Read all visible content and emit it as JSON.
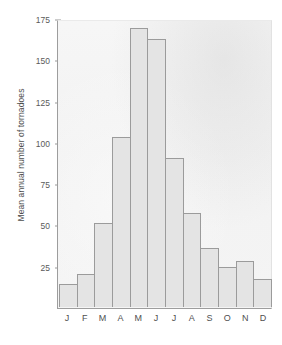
{
  "chart_data": {
    "type": "bar",
    "title": "",
    "xlabel": "",
    "ylabel": "Mean annual number of tornadoes",
    "categories": [
      "J",
      "F",
      "M",
      "A",
      "M",
      "J",
      "J",
      "A",
      "S",
      "O",
      "N",
      "D"
    ],
    "category_names": [
      "January",
      "February",
      "March",
      "April",
      "May",
      "June",
      "July",
      "August",
      "September",
      "October",
      "November",
      "December"
    ],
    "values": [
      14,
      20,
      51,
      103,
      169,
      162,
      90,
      57,
      36,
      24,
      28,
      17
    ],
    "ylim": [
      0,
      175
    ],
    "yticks": [
      25,
      50,
      75,
      100,
      125,
      150,
      175
    ],
    "ytick_labels": [
      "25",
      "50",
      "75",
      "100",
      "125",
      "150",
      "175"
    ],
    "grid": false,
    "legend": null,
    "legend_position": "none",
    "bar_fill_color": "#e4e4e4",
    "bar_edge_color": "#9b9b9b",
    "panel_background_color": "#f3f3f3",
    "axis_color": "#9d9d9d",
    "text_color": "#4f4f4f"
  }
}
